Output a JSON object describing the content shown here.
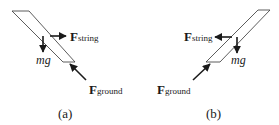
{
  "colors": {
    "background": "#ffffff",
    "ink": "#1a1a1a",
    "plank_stroke": "#333333",
    "plank_fill": "#ffffff"
  },
  "panels": [
    {
      "id": "a",
      "caption": "(a)",
      "forces": {
        "string": {
          "symbol": "F",
          "subscript": "string",
          "direction": "right"
        },
        "gravity": {
          "label": "mg",
          "direction": "down"
        },
        "ground": {
          "symbol": "F",
          "subscript": "ground",
          "direction": "up-left"
        }
      }
    },
    {
      "id": "b",
      "caption": "(b)",
      "forces": {
        "string": {
          "symbol": "F",
          "subscript": "string",
          "direction": "left"
        },
        "gravity": {
          "label": "mg",
          "direction": "down"
        },
        "ground": {
          "symbol": "F",
          "subscript": "ground",
          "direction": "up-right"
        }
      }
    }
  ]
}
